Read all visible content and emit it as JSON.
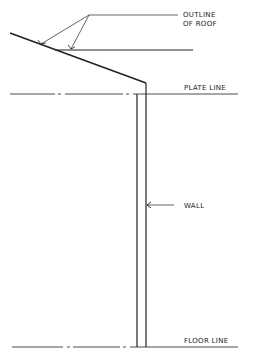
{
  "diagram": {
    "labels": {
      "outline_line1": "OUTLINE",
      "outline_line2": "OF ROOF",
      "plate_line": "PLATE LINE",
      "wall": "WALL",
      "floor_line": "FLOOR LINE"
    },
    "colors": {
      "ink": "#222222",
      "background": "#ffffff"
    }
  }
}
